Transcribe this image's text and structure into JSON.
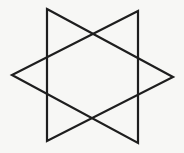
{
  "figure": {
    "background": "#f7f7f5",
    "stroke_color": "#1e1e1e",
    "stroke_width": 2.2,
    "shapes": [
      {
        "name": "triangle-pointing-right",
        "points": [
          [
            47,
            9
          ],
          [
            173,
            77
          ],
          [
            47,
            141
          ]
        ]
      },
      {
        "name": "triangle-pointing-left",
        "points": [
          [
            138,
            11
          ],
          [
            12,
            75
          ],
          [
            138,
            143
          ]
        ]
      }
    ]
  }
}
